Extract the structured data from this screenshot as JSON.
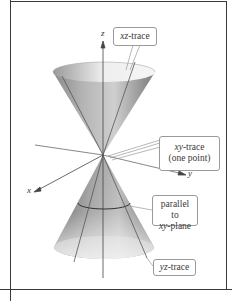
{
  "figure": {
    "axes": {
      "x_label": "x",
      "y_label": "y",
      "z_label": "z"
    },
    "callouts": {
      "xz_trace": {
        "var": "xz",
        "suffix": "-trace"
      },
      "xy_trace": {
        "var": "xy",
        "suffix": "-trace",
        "line2": "(one point)"
      },
      "parallel": {
        "line1": "parallel to",
        "var": "xy",
        "suffix": "-plane"
      },
      "yz_trace": {
        "var": "yz",
        "suffix": "-trace"
      }
    },
    "colors": {
      "frame": "#3a3a3a",
      "cone_dark": "#6e6e6e",
      "cone_light": "#e6e6e6",
      "callout_border": "#9a9a9a",
      "text": "#3a3a3a"
    }
  }
}
